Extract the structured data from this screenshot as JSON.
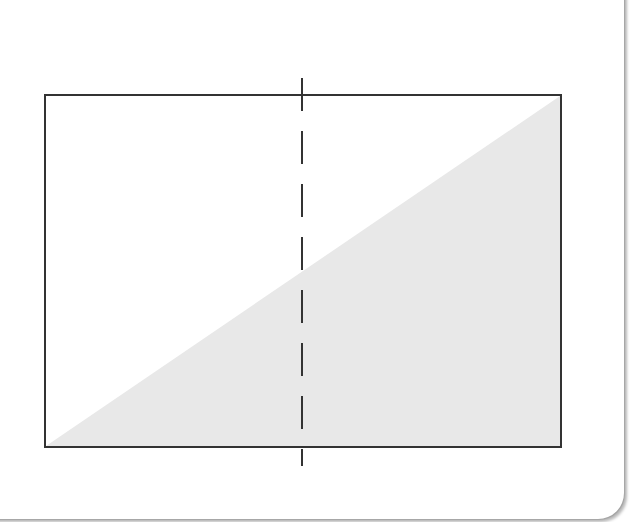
{
  "diagram": {
    "type": "rectangle-with-diagonal-shading-and-dashed-bisector",
    "rectangle": {
      "x1": 45,
      "y1": 95,
      "x2": 561,
      "y2": 447,
      "stroke": "#333333",
      "stroke_width": 2
    },
    "shaded_triangle": {
      "points": "46,446 560,96 560,446",
      "fill": "#e8e8e8"
    },
    "dashed_line": {
      "x": 302,
      "y1": 78,
      "y2": 466,
      "stroke": "#333333",
      "stroke_width": 2,
      "dash": "33,20"
    },
    "colors": {
      "background": "#ffffff",
      "stroke": "#333333",
      "shade": "#e8e8e8"
    }
  }
}
